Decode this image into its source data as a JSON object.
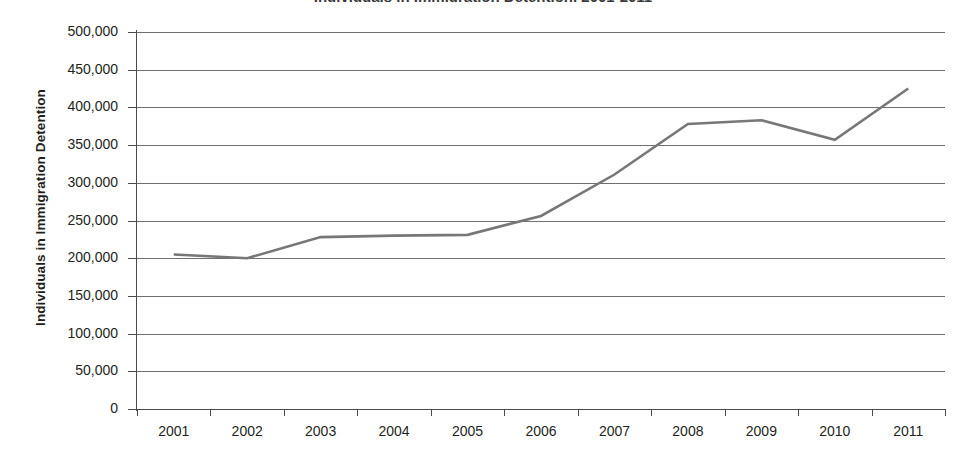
{
  "chart_data": {
    "type": "line",
    "title": "Individuals in Immigration Detention, 2001-2011",
    "xlabel": "",
    "ylabel": "Individuals in Immigration Detention",
    "categories": [
      "2001",
      "2002",
      "2003",
      "2004",
      "2005",
      "2006",
      "2007",
      "2008",
      "2009",
      "2010",
      "2011"
    ],
    "values": [
      205000,
      200000,
      228000,
      230000,
      231000,
      256000,
      311000,
      378000,
      383000,
      357000,
      425000
    ],
    "series": [
      {
        "name": "Individuals in Immigration Detention",
        "values": [
          205000,
          200000,
          228000,
          230000,
          231000,
          256000,
          311000,
          378000,
          383000,
          357000,
          425000
        ]
      }
    ],
    "ylim": [
      0,
      500000
    ],
    "ytick_values": [
      0,
      50000,
      100000,
      150000,
      200000,
      250000,
      300000,
      350000,
      400000,
      450000,
      500000
    ],
    "ytick_labels": [
      "0",
      "50,000",
      "100,000",
      "150,000",
      "200,000",
      "250,000",
      "300,000",
      "350,000",
      "400,000",
      "450,000",
      "500,000"
    ],
    "xtick_labels": [
      "2001",
      "2002",
      "2003",
      "2004",
      "2005",
      "2006",
      "2007",
      "2008",
      "2009",
      "2010",
      "2011"
    ],
    "grid": "horizontal",
    "legend": "none",
    "line_color": "#777777",
    "axis_color": "#4a4a4a",
    "background_color": "#ffffff"
  }
}
